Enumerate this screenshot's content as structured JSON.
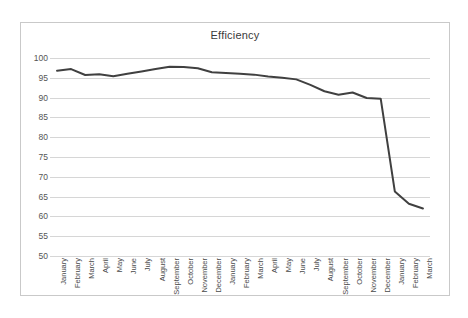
{
  "chart_data": {
    "type": "line",
    "title": "Efficiency",
    "xlabel": "",
    "ylabel": "",
    "ylim": [
      50,
      100
    ],
    "yticks": [
      50,
      55,
      60,
      65,
      70,
      75,
      80,
      85,
      90,
      95,
      100
    ],
    "grid": true,
    "legend": false,
    "legend_position": "none",
    "line_color": "#404040",
    "categories": [
      "January",
      "February",
      "March",
      "April",
      "May",
      "June",
      "July",
      "August",
      "September",
      "October",
      "November",
      "December",
      "January",
      "February",
      "March",
      "April",
      "May",
      "June",
      "July",
      "August",
      "September",
      "October",
      "November",
      "December",
      "January",
      "February",
      "March"
    ],
    "series": [
      {
        "name": "Efficiency",
        "values": [
          96.8,
          97.2,
          95.7,
          95.9,
          95.4,
          96.0,
          96.6,
          97.2,
          97.8,
          97.7,
          97.4,
          96.4,
          96.2,
          96.0,
          95.8,
          95.3,
          95.0,
          94.6,
          93.2,
          91.6,
          90.7,
          91.3,
          89.9,
          89.7,
          66.3,
          63.2,
          62.0
        ]
      }
    ]
  }
}
